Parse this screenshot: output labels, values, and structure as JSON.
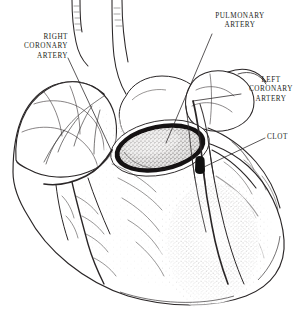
{
  "figure": {
    "kind": "anatomical-line-illustration",
    "style": "pen-and-ink stipple engraving",
    "background_color": "#ffffff",
    "ink_color": "#231f20",
    "width": 303,
    "height": 325
  },
  "labels": [
    {
      "id": "right-coronary-artery",
      "lines": [
        "RIGHT",
        "CORONARY",
        "ARTERY"
      ],
      "text": "RIGHT CORONARY ARTERY",
      "align": "right",
      "x": 14,
      "y": 33,
      "leader": {
        "from_x": 68,
        "from_y": 58,
        "to_x": 112,
        "to_y": 152
      }
    },
    {
      "id": "pulmonary-artery",
      "lines": [
        "PULMONARY",
        "ARTERY"
      ],
      "text": "PULMONARY ARTERY",
      "align": "center",
      "x": 200,
      "y": 12,
      "leader": {
        "from_x": 212,
        "from_y": 34,
        "to_x": 166,
        "to_y": 143
      }
    },
    {
      "id": "left-coronary-artery",
      "lines": [
        "LEFT",
        "CORONARY",
        "ARTERY"
      ],
      "text": "LEFT CORONARY ARTERY",
      "align": "center",
      "x": 243,
      "y": 76,
      "leader": {
        "from_x": 241,
        "from_y": 94,
        "to_x": 193,
        "to_y": 101
      }
    },
    {
      "id": "clot",
      "lines": [
        "CLOT"
      ],
      "text": "CLOT",
      "align": "left",
      "x": 267,
      "y": 133,
      "leader": {
        "from_x": 265,
        "from_y": 138,
        "to_x": 204,
        "to_y": 167
      }
    }
  ],
  "structures": {
    "aorta_cross_section": {
      "name": "aorta-cross-section",
      "center_x": 160,
      "center_y": 148,
      "rx": 48,
      "ry": 25,
      "rotation_deg": -11,
      "rim_color": "#1a1718",
      "lumen_fill": "#b8b4b2"
    },
    "clot_marker": {
      "name": "coronary-clot",
      "x": 200,
      "y": 156,
      "width": 5,
      "height": 17,
      "color": "#121011"
    },
    "infarct_zone": {
      "name": "infarcted-myocardium",
      "center_x": 213,
      "center_y": 243,
      "rx": 44,
      "ry": 58,
      "shade": "#6e6a68"
    },
    "right_atrial_appendage": {
      "name": "right-atrial-appendage",
      "center_x": 58,
      "center_y": 125
    },
    "left_atrial_appendage": {
      "name": "left-atrial-appendage",
      "center_x": 214,
      "center_y": 98
    }
  }
}
